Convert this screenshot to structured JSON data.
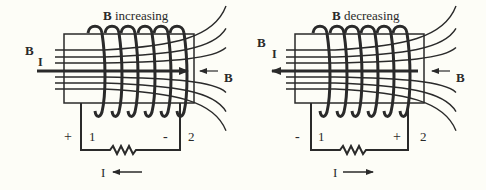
{
  "colors": {
    "ink": "#2a2a2a",
    "background": "#fdfdf7"
  },
  "panels": [
    {
      "id": "increasing",
      "title_bold": "B",
      "title_rest": " increasing",
      "left_field_label": "B",
      "current_label_left": "I",
      "right_field_label": "B",
      "current_arrow_direction": "right",
      "terminal_left_sign": "+",
      "terminal_left_number": "1",
      "terminal_right_sign": "-",
      "terminal_right_number": "2",
      "induced_current_label": "I",
      "induced_current_direction": "left"
    },
    {
      "id": "decreasing",
      "title_bold": "B",
      "title_rest": " decreasing",
      "left_field_label": "B",
      "current_label_left": "I",
      "right_field_label": "B",
      "current_arrow_direction": "left",
      "terminal_left_sign": "-",
      "terminal_left_number": "1",
      "terminal_right_sign": "+",
      "terminal_right_number": "2",
      "induced_current_label": "I",
      "induced_current_direction": "right"
    }
  ]
}
